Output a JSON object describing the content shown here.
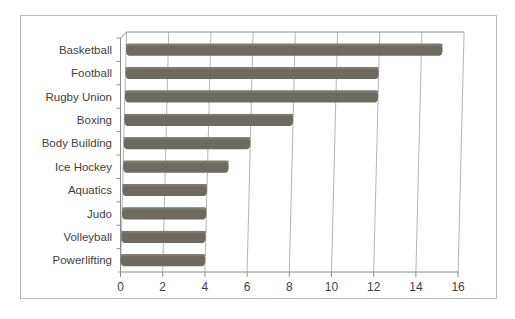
{
  "figure": {
    "background_color": "#ffffff",
    "frame_color": "#b9b9b9"
  },
  "chart_data": {
    "type": "bar",
    "orientation": "horizontal",
    "title": "",
    "subtitle": "",
    "xlabel": "",
    "ylabel": "",
    "categories": [
      "Basketball",
      "Football",
      "Rugby Union",
      "Boxing",
      "Body Building",
      "Ice Hockey",
      "Aquatics",
      "Judo",
      "Volleyball",
      "Powerlifting"
    ],
    "values": [
      15,
      12,
      12,
      8,
      6,
      5,
      4,
      4,
      4,
      4
    ],
    "xlim": [
      0,
      16
    ],
    "xticks": [
      0,
      2,
      4,
      6,
      8,
      10,
      12,
      14,
      16
    ],
    "xtick_labels": [
      "0",
      "2",
      "4",
      "6",
      "8",
      "10",
      "12",
      "14",
      "16"
    ],
    "grid": true,
    "grid_axis": "x",
    "legend": false,
    "legend_position": "none",
    "bar_color": "#6e6a60",
    "grid_color": "#b5b5b5",
    "axis_color": "#8c8c8c",
    "text_color": "#3f3f3f",
    "style_note": "3d-perspective-bar-chart"
  }
}
